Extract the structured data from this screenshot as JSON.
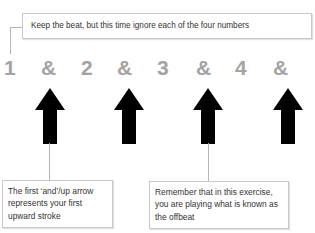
{
  "instruction": {
    "text": "Keep the beat, but this time ignore each of the four numbers"
  },
  "count_row": {
    "items": [
      {
        "label": "1",
        "type": "number"
      },
      {
        "label": "&",
        "type": "and"
      },
      {
        "label": "2",
        "type": "number"
      },
      {
        "label": "&",
        "type": "and"
      },
      {
        "label": "3",
        "type": "number"
      },
      {
        "label": "&",
        "type": "and"
      },
      {
        "label": "4",
        "type": "number"
      },
      {
        "label": "&",
        "type": "and"
      }
    ],
    "color": "#a3a3a3"
  },
  "arrows": {
    "count": 4,
    "direction": "up",
    "color": "#000000",
    "positions": [
      "&",
      "&",
      "&",
      "&"
    ]
  },
  "notes": {
    "left": {
      "text": "The first ‘and’/up arrow represents your first upward stroke"
    },
    "right": {
      "text": "Remember that in this exercise, you are playing what is known as the offbeat"
    }
  }
}
